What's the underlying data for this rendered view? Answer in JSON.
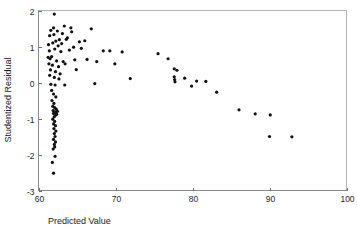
{
  "chart_data": {
    "type": "scatter",
    "title": "",
    "xlabel": "Predicted Value",
    "ylabel": "Studentized Residual",
    "xlim": [
      60,
      100
    ],
    "ylim": [
      -3,
      2
    ],
    "xticks": [
      60,
      70,
      80,
      90,
      100
    ],
    "yticks": [
      2,
      1,
      0,
      -1,
      -2,
      -3
    ],
    "xtick_labels": [
      "60",
      "70",
      "80",
      "90",
      "100"
    ],
    "ytick_labels": [
      "2",
      "1",
      "0",
      "-1",
      "-2",
      "-3"
    ],
    "grid": false,
    "legend": null,
    "marker": "dot",
    "marker_color": "#101010",
    "marker_size": 1.6,
    "points": [
      [
        62.05,
        1.9
      ],
      [
        61.6,
        1.45
      ],
      [
        61.95,
        1.52
      ],
      [
        62.45,
        1.43
      ],
      [
        63.35,
        1.57
      ],
      [
        64.2,
        1.52
      ],
      [
        61.45,
        1.3
      ],
      [
        62.0,
        1.33
      ],
      [
        62.7,
        1.19
      ],
      [
        63.1,
        1.36
      ],
      [
        63.75,
        1.24
      ],
      [
        64.3,
        1.41
      ],
      [
        66.85,
        1.49
      ],
      [
        61.3,
        1.05
      ],
      [
        61.85,
        1.1
      ],
      [
        62.25,
        1.15
      ],
      [
        62.55,
        1.02
      ],
      [
        63.0,
        1.08
      ],
      [
        63.6,
        1.2
      ],
      [
        64.55,
        0.98
      ],
      [
        65.3,
        1.13
      ],
      [
        66.0,
        1.16
      ],
      [
        61.4,
        0.88
      ],
      [
        62.1,
        0.93
      ],
      [
        62.9,
        0.86
      ],
      [
        64.0,
        0.9
      ],
      [
        65.55,
        0.95
      ],
      [
        68.4,
        0.88
      ],
      [
        69.25,
        0.88
      ],
      [
        70.85,
        0.85
      ],
      [
        75.5,
        0.8
      ],
      [
        61.25,
        0.7
      ],
      [
        61.5,
        0.66
      ],
      [
        61.7,
        0.72
      ],
      [
        62.35,
        0.6
      ],
      [
        63.2,
        0.58
      ],
      [
        64.7,
        0.63
      ],
      [
        66.3,
        0.64
      ],
      [
        67.55,
        0.58
      ],
      [
        69.9,
        0.52
      ],
      [
        76.8,
        0.66
      ],
      [
        61.35,
        0.52
      ],
      [
        61.8,
        0.48
      ],
      [
        62.6,
        0.44
      ],
      [
        63.45,
        0.52
      ],
      [
        64.9,
        0.36
      ],
      [
        61.55,
        0.35
      ],
      [
        62.2,
        0.3
      ],
      [
        62.8,
        0.24
      ],
      [
        61.45,
        0.2
      ],
      [
        62.05,
        0.14
      ],
      [
        62.65,
        0.1
      ],
      [
        71.9,
        0.11
      ],
      [
        77.6,
        0.38
      ],
      [
        77.95,
        0.34
      ],
      [
        61.6,
        -0.05
      ],
      [
        62.15,
        -0.07
      ],
      [
        63.4,
        -0.07
      ],
      [
        67.3,
        -0.03
      ],
      [
        77.6,
        0.16
      ],
      [
        77.65,
        0.08
      ],
      [
        77.7,
        0.02
      ],
      [
        78.95,
        0.12
      ],
      [
        79.85,
        -0.1
      ],
      [
        80.5,
        0.04
      ],
      [
        81.7,
        0.03
      ],
      [
        61.7,
        -0.22
      ],
      [
        61.95,
        -0.32
      ],
      [
        62.25,
        -0.4
      ],
      [
        83.1,
        -0.27
      ],
      [
        61.75,
        -0.5
      ],
      [
        62.0,
        -0.58
      ],
      [
        61.85,
        -0.66
      ],
      [
        62.1,
        -0.7
      ],
      [
        62.3,
        -0.74
      ],
      [
        61.9,
        -0.78
      ],
      [
        62.2,
        -0.82
      ],
      [
        62.45,
        -0.8
      ],
      [
        61.95,
        -0.86
      ],
      [
        62.25,
        -0.9
      ],
      [
        62.05,
        -0.95
      ],
      [
        62.35,
        -0.88
      ],
      [
        86.0,
        -0.76
      ],
      [
        88.1,
        -0.87
      ],
      [
        90.05,
        -0.9
      ],
      [
        61.85,
        -1.02
      ],
      [
        62.1,
        -1.08
      ],
      [
        61.95,
        -1.15
      ],
      [
        62.2,
        -1.2
      ],
      [
        62.0,
        -1.28
      ],
      [
        62.25,
        -1.35
      ],
      [
        62.05,
        -1.42
      ],
      [
        62.15,
        -1.5
      ],
      [
        89.95,
        -1.5
      ],
      [
        92.85,
        -1.51
      ],
      [
        61.95,
        -1.58
      ],
      [
        62.2,
        -1.65
      ],
      [
        62.05,
        -1.72
      ],
      [
        62.1,
        -1.79
      ],
      [
        61.9,
        -1.85
      ],
      [
        62.15,
        -2.05
      ],
      [
        61.8,
        -2.22
      ],
      [
        61.95,
        -2.52
      ]
    ]
  },
  "axes": {
    "x_title": "Predicted Value",
    "y_title": "Studentized Residual"
  }
}
